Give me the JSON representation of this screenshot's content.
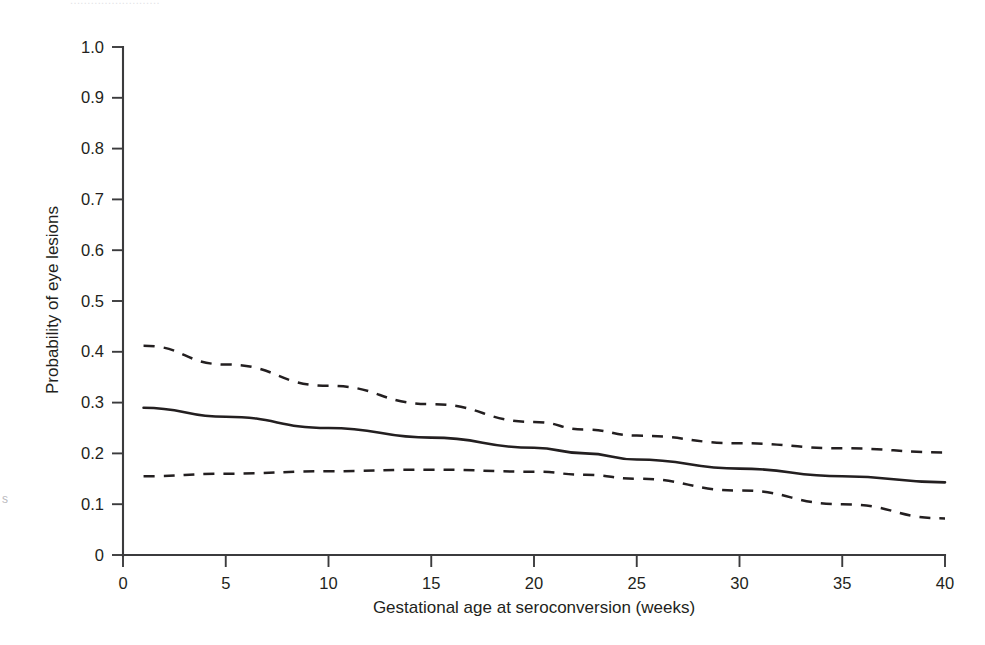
{
  "page": {
    "top_clipped_text": "..........................",
    "left_margin_fragment": "s"
  },
  "chart_data": {
    "type": "line",
    "title": "",
    "xlabel": "Gestational age at seroconversion (weeks)",
    "ylabel": "Probability of eye lesions",
    "xlim": [
      0,
      40
    ],
    "ylim": [
      0,
      1.0
    ],
    "grid": false,
    "legend": null,
    "xticks": [
      0,
      5,
      10,
      15,
      20,
      25,
      30,
      35,
      40
    ],
    "xticklabels": [
      "0",
      "5",
      "10",
      "15",
      "20",
      "25",
      "30",
      "35",
      "40"
    ],
    "yticks": [
      0,
      0.1,
      0.2,
      0.3,
      0.4,
      0.5,
      0.6,
      0.7,
      0.8,
      0.9,
      1.0
    ],
    "yticklabels": [
      "0",
      "0.1",
      "0.2",
      "0.3",
      "0.4",
      "0.5",
      "0.6",
      "0.7",
      "0.8",
      "0.9",
      "1.0"
    ],
    "x": [
      1,
      5,
      10,
      15,
      20,
      22.5,
      25,
      30,
      35,
      40
    ],
    "series": [
      {
        "name": "Upper 95% confidence limit",
        "style": "dashed",
        "values": [
          0.412,
          0.375,
          0.333,
          0.297,
          0.262,
          0.247,
          0.235,
          0.22,
          0.21,
          0.202
        ]
      },
      {
        "name": "Predicted probability",
        "style": "solid",
        "values": [
          0.29,
          0.272,
          0.25,
          0.231,
          0.211,
          0.2,
          0.188,
          0.17,
          0.155,
          0.143
        ]
      },
      {
        "name": "Lower 95% confidence limit",
        "style": "dashed",
        "values": [
          0.155,
          0.16,
          0.165,
          0.168,
          0.164,
          0.158,
          0.15,
          0.127,
          0.1,
          0.072
        ]
      }
    ]
  }
}
